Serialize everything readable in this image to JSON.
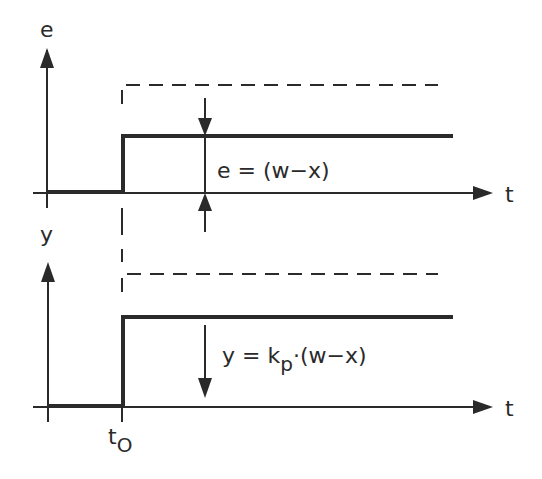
{
  "diagram": {
    "type": "step-response-proportional-controller",
    "colors": {
      "ink": "#2a2a2a",
      "background": "#ffffff"
    },
    "top_plot": {
      "y_axis_label": "e",
      "x_axis_label": "t",
      "annotation": "e = (w−x)"
    },
    "bottom_plot": {
      "y_axis_label": "y",
      "x_axis_label": "t",
      "annotation_lhs": "y = k",
      "annotation_sub": "p",
      "annotation_rhs": "·(w−x)",
      "t0_label": "t",
      "t0_sub": "O"
    }
  }
}
